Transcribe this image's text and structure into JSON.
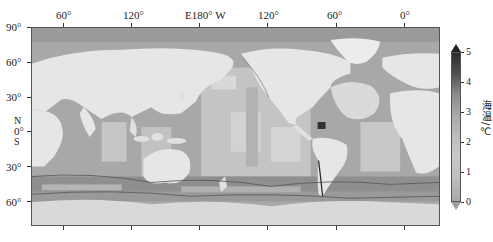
{
  "figure": {
    "type": "global-map",
    "projection": "equirectangular, Pacific-centered",
    "variable_label": "海温/℃",
    "colormap": "grayscale"
  },
  "axes": {
    "top_lon_labels": [
      "60°",
      "120°",
      "E180° W",
      "120°",
      "60°",
      "0°"
    ],
    "left_lat_labels": [
      "90°",
      "60°",
      "30°",
      "0°",
      "30°",
      "60°"
    ],
    "hemisphere_labels": {
      "north": "N",
      "south": "S"
    }
  },
  "colorbar": {
    "title": "海温/℃",
    "ticks": [
      "5",
      "4",
      "3",
      "2",
      "1",
      "0"
    ],
    "min": 0,
    "max": 5,
    "extend": "both",
    "colors": {
      "low": "#a9a9a9",
      "mid": "#c8c8c8",
      "high": "#2a2a2a"
    }
  },
  "map_colors": {
    "land": "#e6e6e6",
    "ocean_deep": "#9a9a9a",
    "ocean_mid": "#b4b4b4",
    "ocean_light": "#cfcfcf",
    "antarctica": "#d9d9d9",
    "contour": "#555555",
    "hotspot": "#333333"
  }
}
